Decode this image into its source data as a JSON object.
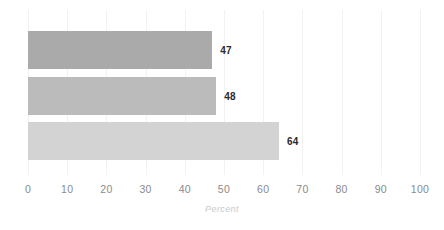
{
  "chart_data": {
    "type": "bar",
    "orientation": "horizontal",
    "title": "",
    "subtitle": "",
    "xlabel": "Percent",
    "ylabel": "",
    "xlim": [
      0,
      100
    ],
    "grid": true,
    "legend": false,
    "categories": [
      "",
      "",
      ""
    ],
    "values": [
      47,
      48,
      64
    ],
    "data_labels": [
      "47",
      "48",
      "64"
    ],
    "xticks": [
      0,
      10,
      20,
      30,
      40,
      50,
      60,
      70,
      80,
      90,
      100
    ],
    "xtick_labels": [
      "0",
      "10",
      "20",
      "30",
      "40",
      "50",
      "60",
      "70",
      "80",
      "90",
      "100"
    ],
    "bars": [
      {
        "label": "",
        "value": 47,
        "data_label": "47",
        "color": "#aaaaaa"
      },
      {
        "label": "",
        "value": 48,
        "data_label": "48",
        "color": "#bbbbbb"
      },
      {
        "label": "",
        "value": 64,
        "data_label": "64",
        "color": "#d3d3d3"
      }
    ]
  },
  "colors": {
    "background": "#ffffff",
    "gridline": "#f2f2f2",
    "tick_label": "#8a8a8a",
    "axis_title": "#c9c9c9",
    "value_label": "#2b2b2b"
  }
}
